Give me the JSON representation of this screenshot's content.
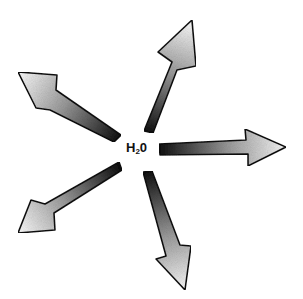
{
  "diagram": {
    "center_label": {
      "main": "H",
      "subscript": "2",
      "suffix": "0"
    },
    "arrows": [
      {
        "direction": "up-right"
      },
      {
        "direction": "up-left"
      },
      {
        "direction": "right"
      },
      {
        "direction": "down-left"
      },
      {
        "direction": "down-right"
      }
    ],
    "colors": {
      "dark": "#111111",
      "light": "#f2f2f2",
      "outline": "#111111"
    }
  }
}
